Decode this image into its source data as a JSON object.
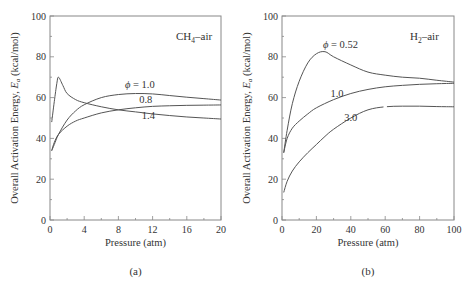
{
  "chart_data": [
    {
      "type": "line",
      "panel_label": "(a)",
      "title": "CH4–air",
      "title_main": "CH",
      "title_sub": "4",
      "title_rest": "–air",
      "xlabel": "Pressure (atm)",
      "ylabel": "Overall Activation Energy, Ea (kcal/mol)",
      "xlim": [
        0,
        20
      ],
      "ylim": [
        0,
        100
      ],
      "xticks": [
        0,
        4,
        8,
        12,
        16,
        20
      ],
      "yticks": [
        0,
        20,
        40,
        60,
        80,
        100
      ],
      "grid": false,
      "series": [
        {
          "name": "φ = 1.0",
          "label": "ϕ = 1.0",
          "x": [
            0.2,
            0.5,
            1,
            2,
            3,
            4,
            6,
            8,
            10,
            12,
            14,
            16,
            18,
            20
          ],
          "y": [
            34,
            37,
            42,
            49,
            53.5,
            56.5,
            60,
            61.5,
            62,
            61.8,
            61,
            60.2,
            59.5,
            58.8
          ]
        },
        {
          "name": "φ = 0.8",
          "label": "0.8",
          "x": [
            0.2,
            0.5,
            1,
            2,
            3,
            4,
            6,
            8,
            10,
            12,
            14,
            16,
            18,
            20
          ],
          "y": [
            34,
            38,
            42,
            46,
            48.5,
            50,
            52.5,
            54,
            55,
            55.7,
            56,
            56.2,
            56.3,
            56.4
          ]
        },
        {
          "name": "φ = 1.4",
          "label": "1.4",
          "x": [
            0.2,
            0.5,
            0.8,
            1.0,
            1.5,
            2,
            3,
            4,
            6,
            8,
            10,
            12,
            14,
            16,
            18,
            20
          ],
          "y": [
            48,
            58,
            67,
            70,
            66,
            62,
            59,
            57.5,
            55.5,
            54,
            53,
            52,
            51.2,
            50.5,
            50,
            49.5
          ]
        }
      ]
    },
    {
      "type": "line",
      "panel_label": "(b)",
      "title": "H2–air",
      "title_main": "H",
      "title_sub": "2",
      "title_rest": "–air",
      "xlabel": "Pressure (atm)",
      "ylabel": "Overall Activation Energy, Ea (kcal/mol)",
      "xlim": [
        0,
        100
      ],
      "ylim": [
        0,
        100
      ],
      "xticks": [
        0,
        20,
        40,
        60,
        80,
        100
      ],
      "yticks": [
        0,
        20,
        40,
        60,
        80,
        100
      ],
      "grid": false,
      "series": [
        {
          "name": "φ = 0.52",
          "label": "ϕ = 0.52",
          "x": [
            1,
            3,
            6,
            10,
            15,
            20,
            25,
            30,
            40,
            50,
            60,
            70,
            80,
            90,
            100
          ],
          "y": [
            33,
            44,
            57,
            68,
            77,
            81.5,
            82.5,
            80,
            76,
            72.5,
            71,
            70,
            69.5,
            68.5,
            67.6
          ]
        },
        {
          "name": "φ = 1.0",
          "label": "1.0",
          "x": [
            1,
            3,
            6,
            10,
            15,
            20,
            30,
            40,
            50,
            60,
            70,
            80,
            90,
            100
          ],
          "y": [
            33,
            40,
            45,
            48.5,
            52,
            55,
            59,
            62,
            64,
            65.3,
            66,
            66.5,
            66.8,
            67
          ]
        },
        {
          "name": "φ = 3.0",
          "label": "3.0",
          "x": [
            1,
            3,
            6,
            10,
            15,
            20,
            25,
            30,
            40,
            50,
            60,
            70,
            80,
            90,
            100
          ],
          "y": [
            13.5,
            19,
            24,
            28.5,
            33,
            37,
            41,
            44.5,
            50,
            54,
            55.5,
            55.8,
            55.8,
            55.6,
            55.5
          ]
        }
      ]
    }
  ],
  "series_label_positions": {
    "a": [
      {
        "text": "ϕ = 1.0",
        "x": 10.5,
        "y": 64.5
      },
      {
        "text": "0.8",
        "x": 11.2,
        "y": 57.5
      },
      {
        "text": "1.4",
        "x": 11.5,
        "y": 49.3
      }
    ],
    "b": [
      {
        "text": "ϕ = 0.52",
        "x": 34,
        "y": 84.5
      },
      {
        "text": "1.0",
        "x": 32,
        "y": 60.5
      },
      {
        "text": "3.0",
        "x": 40,
        "y": 48.5
      }
    ]
  }
}
